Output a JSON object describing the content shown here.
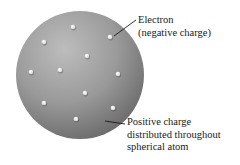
{
  "sphere": {
    "cx": 80,
    "cy": 75,
    "r": 64,
    "highlight_color": "#bdbdbd",
    "mid_color": "#9a9a9a",
    "shadow_color": "#6a6a6a"
  },
  "electron_color": "#f4f4f4",
  "electrons": [
    {
      "x": 73,
      "y": 27
    },
    {
      "x": 44,
      "y": 42
    },
    {
      "x": 110,
      "y": 37
    },
    {
      "x": 87,
      "y": 56
    },
    {
      "x": 31,
      "y": 72
    },
    {
      "x": 60,
      "y": 70
    },
    {
      "x": 118,
      "y": 74
    },
    {
      "x": 85,
      "y": 93
    },
    {
      "x": 44,
      "y": 103
    },
    {
      "x": 113,
      "y": 108
    },
    {
      "x": 76,
      "y": 119
    }
  ],
  "labels": {
    "electron": {
      "line1": "Electron",
      "line2": "(negative charge)",
      "leader": {
        "x1": 114,
        "y1": 36,
        "x2": 136,
        "y2": 20
      }
    },
    "positive": {
      "line1": "Positive charge",
      "line2": "distributed throughout",
      "line3": "spherical atom",
      "leader": {
        "x1": 105,
        "y1": 121,
        "x2": 125,
        "y2": 124
      }
    }
  }
}
